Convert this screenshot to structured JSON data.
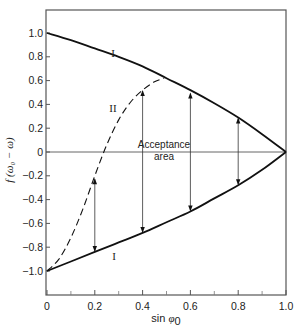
{
  "chart_data": {
    "type": "line",
    "title": "",
    "xlabel": "sin φ0",
    "ylabel": "f(ω0 − ω)",
    "xlim": [
      0,
      1.0
    ],
    "ylim": [
      -1.2,
      1.2
    ],
    "grid": false,
    "x_ticks": [
      0,
      0.2,
      0.4,
      0.6,
      0.8,
      1.0
    ],
    "x_tick_labels": [
      "0",
      "0.2",
      "0.4",
      "0.6",
      "0.8",
      "1.0"
    ],
    "x_minor_ticks": [
      0.1,
      0.3,
      0.5,
      0.7,
      0.9
    ],
    "y_ticks": [
      1.0,
      0.8,
      0.6,
      0.4,
      0.2,
      0,
      -0.2,
      -0.4,
      -0.6,
      -0.8,
      -1.0
    ],
    "y_tick_labels": [
      "1.0",
      "0.8",
      "0.6",
      "0.4",
      "0.2",
      "0",
      "−0.2",
      "−0.4",
      "−0.6",
      "−0.8",
      "−1.0"
    ],
    "series": [
      {
        "name": "I (upper)",
        "style": "solid",
        "x": [
          0,
          0.1,
          0.2,
          0.3,
          0.4,
          0.5,
          0.6,
          0.7,
          0.8,
          0.9,
          1.0
        ],
        "y": [
          1.0,
          0.94,
          0.87,
          0.8,
          0.72,
          0.62,
          0.52,
          0.41,
          0.29,
          0.15,
          0
        ]
      },
      {
        "name": "I (lower)",
        "style": "solid",
        "x": [
          0,
          0.1,
          0.2,
          0.3,
          0.4,
          0.5,
          0.6,
          0.7,
          0.8,
          0.9,
          1.0
        ],
        "y": [
          -1.0,
          -0.92,
          -0.84,
          -0.76,
          -0.68,
          -0.59,
          -0.5,
          -0.39,
          -0.28,
          -0.15,
          0
        ]
      },
      {
        "name": "II",
        "style": "dashed",
        "x": [
          0,
          0.05,
          0.1,
          0.15,
          0.2,
          0.25,
          0.3,
          0.35,
          0.4,
          0.45,
          0.49
        ],
        "y": [
          -1.0,
          -0.9,
          -0.72,
          -0.48,
          -0.2,
          0.06,
          0.27,
          0.42,
          0.52,
          0.59,
          0.62
        ]
      }
    ],
    "arrows": [
      {
        "x": 0.2,
        "y_top": -0.22,
        "y_bottom": -0.84
      },
      {
        "x": 0.4,
        "y_top": 0.52,
        "y_bottom": -0.68
      },
      {
        "x": 0.6,
        "y_top": 0.5,
        "y_bottom": -0.5
      },
      {
        "x": 0.8,
        "y_top": 0.29,
        "y_bottom": -0.28
      }
    ],
    "annotations": [
      {
        "text": "I",
        "x": 0.28,
        "y": 0.83
      },
      {
        "text": "II",
        "x": 0.28,
        "y": 0.37
      },
      {
        "text": "I",
        "x": 0.28,
        "y": -0.87
      },
      {
        "text": "Acceptance",
        "x": 0.49,
        "y": 0.06
      },
      {
        "text": "area",
        "x": 0.49,
        "y": -0.06
      }
    ]
  },
  "labels": {
    "xlabel_main": "sin ",
    "xlabel_symbol": "φ",
    "xlabel_sub": "0",
    "ylabel": "f (ω₀ − ω)",
    "curve_I_upper": "I",
    "curve_II": "II",
    "curve_I_lower": "I",
    "acceptance_line1": "Acceptance",
    "acceptance_line2": "area"
  }
}
